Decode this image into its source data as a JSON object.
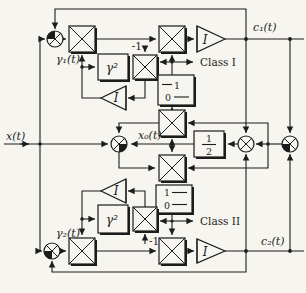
{
  "figure": {
    "type": "signal-flow-block-diagram",
    "colors": {
      "ink": "#1c1c1c",
      "paper": "#f6f5ef"
    },
    "labels": {
      "input": "x(t)",
      "center_output": "x₀(t)",
      "top_output": "c₁(t)",
      "bottom_output": "c₂(t)",
      "weight_top": "γ₁(t)",
      "weight_bottom": "γ₂(t)",
      "squarer": "γ²",
      "minus_one": "-1",
      "class_top": "Class I",
      "class_bottom": "Class II",
      "integrator": "I",
      "half_numerator": "1",
      "half_denominator": "2",
      "comparator_one": "1",
      "comparator_zero": "0"
    }
  }
}
